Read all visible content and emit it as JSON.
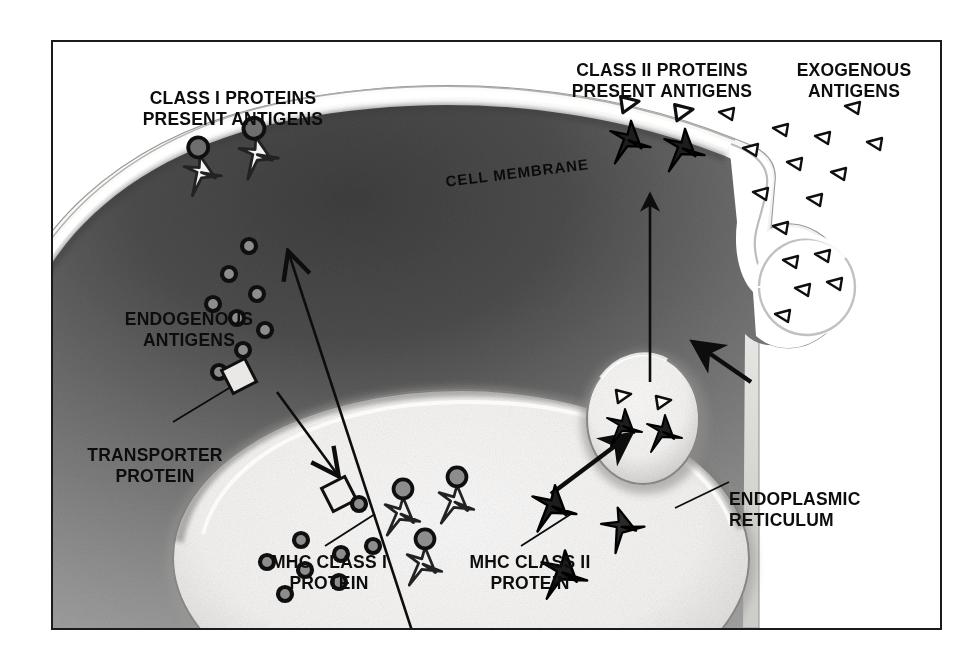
{
  "figure": {
    "kind": "biology-diagram",
    "frame_border_color": "#1b1b1b",
    "background_color": "#ffffff"
  },
  "labels": {
    "class_i": "CLASS I PROTEINS\nPRESENT ANTIGENS",
    "class_ii": "CLASS II PROTEINS\nPRESENT ANTIGENS",
    "exogenous": "EXOGENOUS\nANTIGENS",
    "cell_membrane": "CELL MEMBRANE",
    "endogenous": "ENDOGENOUS\nANTIGENS",
    "transporter": "TRANSPORTER\nPROTEIN",
    "mhc_class_i": "MHC CLASS I\nPROTEIN",
    "mhc_class_ii": "MHC CLASS II\nPROTEIN",
    "endoplasmic_reticulum": "ENDOPLASMIC\nRETICULUM"
  },
  "structures": {
    "cell_membrane": {
      "name": "cell-membrane",
      "fill": "#f2f0ee",
      "rim": "#8e8e8e"
    },
    "cytoplasm": {
      "name": "cytoplasm",
      "fill_dark": "#4a4a4a",
      "fill_light": "#9c9c9c"
    },
    "endoplasmic_reticulum": {
      "name": "endoplasmic-reticulum",
      "fill": "#f6f5f3",
      "rim": "#8b8b8b"
    },
    "endosome_vesicle": {
      "name": "endosome-vesicle",
      "fill": "#f7f6f4",
      "rim": "#8b8b8b"
    },
    "invagination": {
      "name": "membrane-invagination",
      "fill": "#ffffff"
    }
  },
  "symbols": {
    "mhc_class_i_protein": {
      "glyph": "light-star-with-sphere",
      "stroke": "#2a2a2a",
      "fill": "#f3f2f0",
      "note": "open outlined star bearing a dark sphere (endogenous antigen)"
    },
    "mhc_class_ii_protein": {
      "glyph": "dark-star",
      "stroke": "#111111",
      "fill": "#1d1d1d",
      "note": "solid dark star, carries triangular exogenous antigen when loaded"
    },
    "endogenous_antigen": {
      "glyph": "ring-circle",
      "stroke": "#111111",
      "fill": "#8d8d8d"
    },
    "exogenous_antigen": {
      "glyph": "small-triangle",
      "stroke": "#111111",
      "fill": "#ffffff"
    },
    "transporter_protein": {
      "glyph": "diamond",
      "stroke": "#111111",
      "fill": "#e9e8e6"
    }
  },
  "counts": {
    "surface_class_i_proteins": 2,
    "surface_class_ii_proteins": 2,
    "endogenous_antigens_cytoplasm": 8,
    "endogenous_antigens_er": 8,
    "exogenous_antigens_outside": 11,
    "exogenous_antigens_in_pocket": 5,
    "er_mhc_class_i_proteins": 3,
    "er_mhc_class_ii_proteins": 3,
    "vesicle_class_ii_proteins": 2,
    "transporter_proteins": 2
  },
  "arrows": [
    {
      "name": "arrow-er-to-membrane-class-i",
      "from": "endoplasmic reticulum",
      "to": "cell membrane",
      "direction": "up-left"
    },
    {
      "name": "arrow-cytoplasm-to-er-transporter",
      "from": "cytoplasm transporter protein",
      "to": "endoplasmic reticulum lumen",
      "direction": "down-right"
    },
    {
      "name": "arrow-invagination-to-vesicle",
      "from": "membrane invagination",
      "to": "endosome vesicle",
      "direction": "down-left"
    },
    {
      "name": "arrow-er-to-vesicle-class-ii",
      "from": "endoplasmic reticulum",
      "to": "endosome vesicle",
      "direction": "up-right"
    },
    {
      "name": "arrow-vesicle-to-membrane-class-ii",
      "from": "endosome vesicle",
      "to": "cell membrane",
      "direction": "up"
    }
  ],
  "leader_lines": [
    {
      "name": "leader-transporter-protein"
    },
    {
      "name": "leader-mhc-class-i"
    },
    {
      "name": "leader-mhc-class-ii"
    },
    {
      "name": "leader-endoplasmic-reticulum"
    }
  ]
}
